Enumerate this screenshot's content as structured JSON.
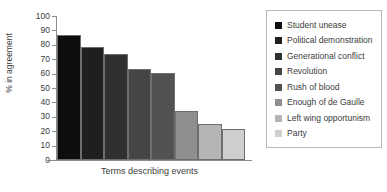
{
  "chart_data": {
    "type": "bar",
    "title": "",
    "subtitle": "",
    "xlabel": "Terms describing events",
    "ylabel": "% in agreement",
    "ylim": [
      0,
      100
    ],
    "yticks": [
      0,
      10,
      20,
      30,
      40,
      50,
      60,
      70,
      80,
      90,
      100
    ],
    "ytick_labels": [
      "0",
      "10",
      "20",
      "30",
      "40",
      "50",
      "60",
      "70",
      "80",
      "90",
      "100"
    ],
    "xtick_labels": [],
    "grid": false,
    "legend_position": "right",
    "categories": [
      "Student unease",
      "Political demonstration",
      "Generational conflict",
      "Revolution",
      "Rush of blood",
      "Enough of de Gaulle",
      "Left wing opportunism",
      "Party"
    ],
    "values": [
      87,
      78.5,
      73.5,
      63,
      60.5,
      34,
      25,
      21.5
    ],
    "colors": [
      "#0d0d0d",
      "#1f1f1f",
      "#303030",
      "#454545",
      "#525252",
      "#8f8f8f",
      "#b5b5b5",
      "#cfcfcf"
    ],
    "bar_edge_color": "#6e6e6e",
    "axis_color": "#8d8d8d",
    "text_color": "#3c3c3c",
    "background": "#ffffff"
  },
  "legend": {
    "entries": [
      {
        "label": "Student unease",
        "color": "#0d0d0d"
      },
      {
        "label": "Political demonstration",
        "color": "#1f1f1f"
      },
      {
        "label": "Generational conflict",
        "color": "#303030"
      },
      {
        "label": "Revolution",
        "color": "#454545"
      },
      {
        "label": "Rush of blood",
        "color": "#525252"
      },
      {
        "label": "Enough of de Gaulle",
        "color": "#8f8f8f"
      },
      {
        "label": "Left wing opportunism",
        "color": "#b5b5b5"
      },
      {
        "label": "Party",
        "color": "#cfcfcf"
      }
    ]
  }
}
